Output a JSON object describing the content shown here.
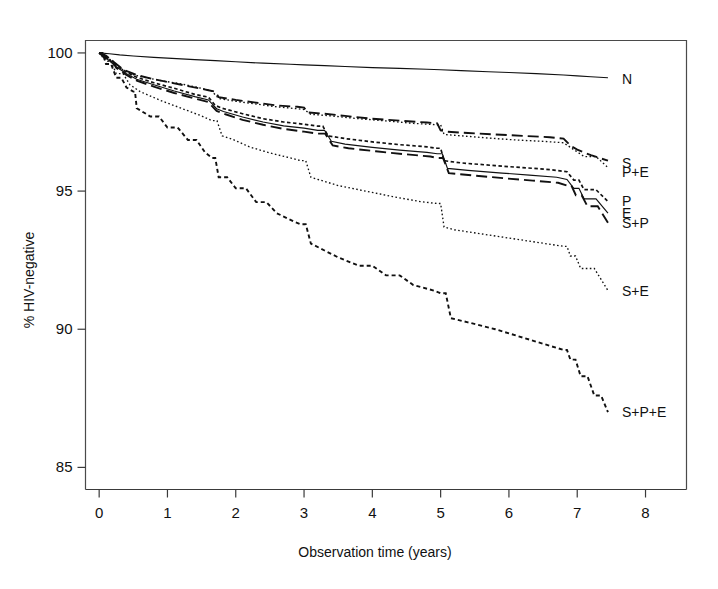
{
  "chart_data": {
    "type": "line",
    "title": "",
    "xlabel": "Observation time (years)",
    "ylabel": "% HIV-negative",
    "xlim": [
      -0.2,
      8.6
    ],
    "ylim": [
      84.2,
      100.45
    ],
    "xticks": [
      0,
      1,
      2,
      3,
      4,
      5,
      6,
      7,
      8
    ],
    "xtick_labels": [
      "0",
      "1",
      "2",
      "3",
      "4",
      "5",
      "6",
      "7",
      "8"
    ],
    "yticks": [
      85,
      90,
      95,
      100
    ],
    "ytick_labels": [
      "85",
      "90",
      "95",
      "100"
    ],
    "grid": false,
    "legend_position": "right-inline-end-of-curve",
    "series": [
      {
        "name": "N",
        "label": "N",
        "linestyle": "solid",
        "label_y_value": 99.05,
        "x": [
          0,
          0.15,
          0.3,
          0.5,
          0.8,
          1.0,
          1.4,
          1.7,
          2.0,
          2.4,
          2.8,
          3.0,
          3.3,
          3.6,
          4.0,
          4.4,
          4.8,
          5.0,
          5.3,
          5.7,
          6.0,
          6.4,
          6.8,
          7.0,
          7.2,
          7.45
        ],
        "y": [
          100.0,
          99.97,
          99.93,
          99.89,
          99.84,
          99.81,
          99.76,
          99.72,
          99.68,
          99.63,
          99.59,
          99.57,
          99.54,
          99.51,
          99.47,
          99.44,
          99.41,
          99.39,
          99.36,
          99.32,
          99.29,
          99.25,
          99.2,
          99.17,
          99.14,
          99.1
        ]
      },
      {
        "name": "S",
        "label": "S",
        "linestyle": "long-dash",
        "label_y_value": 96.0,
        "x": [
          0,
          0.1,
          0.2,
          0.35,
          0.5,
          0.55,
          0.8,
          1.0,
          1.3,
          1.6,
          1.7,
          1.75,
          2.0,
          2.3,
          2.6,
          2.9,
          3.0,
          3.05,
          3.3,
          3.6,
          4.0,
          4.4,
          4.8,
          4.95,
          5.0,
          5.1,
          5.4,
          5.8,
          6.2,
          6.6,
          6.8,
          6.9,
          7.0,
          7.2,
          7.45
        ],
        "y": [
          100.0,
          99.9,
          99.7,
          99.4,
          99.25,
          99.2,
          99.05,
          98.95,
          98.8,
          98.65,
          98.6,
          98.4,
          98.3,
          98.2,
          98.1,
          98.05,
          98.02,
          97.85,
          97.8,
          97.72,
          97.62,
          97.55,
          97.48,
          97.45,
          97.2,
          97.15,
          97.1,
          97.05,
          97.0,
          96.95,
          96.9,
          96.65,
          96.5,
          96.3,
          96.1
        ]
      },
      {
        "name": "P+E",
        "label": "P+E",
        "linestyle": "fine-dot",
        "label_y_value": 95.7,
        "x": [
          0,
          0.1,
          0.2,
          0.35,
          0.5,
          0.6,
          0.9,
          1.2,
          1.5,
          1.65,
          1.75,
          2.0,
          2.3,
          2.6,
          2.9,
          3.0,
          3.1,
          3.4,
          3.8,
          4.2,
          4.6,
          4.95,
          5.05,
          5.3,
          5.7,
          6.1,
          6.5,
          6.8,
          6.95,
          7.1,
          7.45
        ],
        "y": [
          100.0,
          99.88,
          99.68,
          99.38,
          99.22,
          99.15,
          99.0,
          98.88,
          98.72,
          98.62,
          98.35,
          98.25,
          98.15,
          98.05,
          97.98,
          97.95,
          97.78,
          97.72,
          97.62,
          97.54,
          97.45,
          97.4,
          97.05,
          97.0,
          96.92,
          96.85,
          96.8,
          96.75,
          96.5,
          96.25,
          95.85
        ]
      },
      {
        "name": "P",
        "label": "P",
        "linestyle": "short-dash",
        "label_y_value": 94.65,
        "x": [
          0,
          0.1,
          0.25,
          0.4,
          0.55,
          0.8,
          1.1,
          1.4,
          1.6,
          1.7,
          1.8,
          2.1,
          2.4,
          2.7,
          3.0,
          3.2,
          3.35,
          3.6,
          4.0,
          4.4,
          4.8,
          4.95,
          5.05,
          5.3,
          5.8,
          6.2,
          6.6,
          6.85,
          6.95,
          7.1,
          7.45
        ],
        "y": [
          100.0,
          99.85,
          99.55,
          99.3,
          99.12,
          98.92,
          98.72,
          98.5,
          98.4,
          98.1,
          98.0,
          97.8,
          97.62,
          97.5,
          97.42,
          97.35,
          97.0,
          96.9,
          96.78,
          96.68,
          96.6,
          96.55,
          96.1,
          96.02,
          95.92,
          95.85,
          95.78,
          95.7,
          95.4,
          95.05,
          94.62
        ]
      },
      {
        "name": "E",
        "label": "E",
        "linestyle": "solid",
        "label_y_value": 94.2,
        "x": [
          0,
          0.1,
          0.25,
          0.4,
          0.55,
          0.8,
          1.1,
          1.4,
          1.6,
          1.72,
          1.82,
          2.1,
          2.4,
          2.7,
          3.0,
          3.2,
          3.4,
          3.6,
          4.0,
          4.4,
          4.8,
          4.95,
          5.1,
          5.4,
          5.9,
          6.3,
          6.7,
          6.85,
          6.95,
          7.1,
          7.45
        ],
        "y": [
          100.0,
          99.82,
          99.5,
          99.25,
          99.05,
          98.85,
          98.62,
          98.42,
          98.3,
          97.98,
          97.88,
          97.68,
          97.5,
          97.36,
          97.28,
          97.2,
          96.8,
          96.7,
          96.58,
          96.48,
          96.4,
          96.35,
          95.82,
          95.75,
          95.65,
          95.58,
          95.5,
          95.42,
          95.1,
          94.72,
          94.2
        ]
      },
      {
        "name": "S+P",
        "label": "S+P",
        "linestyle": "long-dash",
        "label_y_value": 93.85,
        "x": [
          0,
          0.1,
          0.25,
          0.4,
          0.55,
          0.8,
          1.1,
          1.4,
          1.6,
          1.72,
          1.85,
          2.1,
          2.4,
          2.7,
          3.0,
          3.2,
          3.42,
          3.65,
          4.05,
          4.45,
          4.85,
          4.95,
          5.12,
          5.5,
          5.95,
          6.35,
          6.72,
          6.85,
          6.98,
          7.15,
          7.45
        ],
        "y": [
          100.0,
          99.8,
          99.46,
          99.2,
          99.0,
          98.78,
          98.55,
          98.35,
          98.22,
          97.9,
          97.78,
          97.58,
          97.4,
          97.25,
          97.15,
          97.08,
          96.65,
          96.55,
          96.44,
          96.34,
          96.25,
          96.2,
          95.65,
          95.56,
          95.46,
          95.38,
          95.3,
          95.2,
          94.85,
          94.45,
          93.85
        ]
      },
      {
        "name": "S+E",
        "label": "S+E",
        "linestyle": "fine-dot",
        "label_y_value": 91.4,
        "x": [
          0,
          0.1,
          0.25,
          0.45,
          0.6,
          0.9,
          1.2,
          1.5,
          1.65,
          1.8,
          1.95,
          2.2,
          2.5,
          2.8,
          2.95,
          3.1,
          3.3,
          3.5,
          3.9,
          4.3,
          4.7,
          4.95,
          5.05,
          5.2,
          5.6,
          6.0,
          6.4,
          6.8,
          6.9,
          7.05,
          7.45
        ],
        "y": [
          100.0,
          99.7,
          99.25,
          98.85,
          98.6,
          98.28,
          98.0,
          97.72,
          97.55,
          97.0,
          96.88,
          96.6,
          96.38,
          96.2,
          96.1,
          95.5,
          95.35,
          95.2,
          95.0,
          94.8,
          94.62,
          94.55,
          93.7,
          93.6,
          93.45,
          93.3,
          93.15,
          93.0,
          92.65,
          92.2,
          91.4
        ]
      },
      {
        "name": "S+P+E",
        "label": "S+P+E",
        "linestyle": "med-dash",
        "label_y_value": 87.0,
        "x": [
          0,
          0.1,
          0.25,
          0.4,
          0.5,
          0.55,
          0.75,
          1.0,
          1.3,
          1.55,
          1.65,
          1.75,
          2.0,
          2.3,
          2.6,
          2.85,
          2.95,
          3.1,
          3.3,
          3.5,
          3.8,
          4.2,
          4.6,
          4.9,
          5.0,
          5.15,
          5.4,
          5.8,
          6.2,
          6.6,
          6.8,
          6.9,
          7.05,
          7.25,
          7.45
        ],
        "y": [
          100.0,
          99.6,
          99.1,
          98.75,
          98.6,
          98.0,
          97.7,
          97.3,
          96.85,
          96.4,
          96.2,
          95.5,
          95.1,
          94.6,
          94.2,
          93.9,
          93.8,
          93.1,
          92.85,
          92.6,
          92.3,
          91.95,
          91.6,
          91.4,
          91.3,
          90.4,
          90.25,
          90.0,
          89.7,
          89.4,
          89.25,
          88.9,
          88.3,
          87.6,
          87.0
        ]
      }
    ]
  }
}
